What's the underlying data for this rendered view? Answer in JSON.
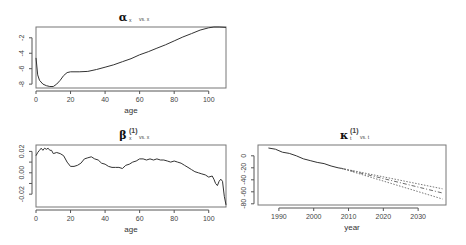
{
  "chart_data": [
    {
      "id": "alpha",
      "type": "line",
      "title": "α",
      "title_subscript": "x",
      "title_suffix": "vs. x",
      "xlabel": "age",
      "ylabel": "",
      "xlim": [
        0,
        110
      ],
      "ylim": [
        -8.5,
        -0.6
      ],
      "xticks": [
        0,
        20,
        40,
        60,
        80,
        100
      ],
      "yticks": [
        -2,
        -4,
        -6,
        -8
      ],
      "grid": false,
      "box": {
        "left": 36,
        "top": 27,
        "right": 226,
        "bottom": 88
      },
      "series": [
        {
          "name": "alpha_x",
          "style": "solid",
          "x": [
            0,
            1,
            2,
            4,
            6,
            8,
            10,
            12,
            14,
            16,
            18,
            20,
            25,
            30,
            35,
            40,
            45,
            50,
            55,
            60,
            65,
            70,
            75,
            80,
            85,
            90,
            95,
            100,
            103,
            106,
            110
          ],
          "y": [
            -4.6,
            -6.8,
            -7.5,
            -8.0,
            -8.2,
            -8.3,
            -8.3,
            -8.0,
            -7.5,
            -6.9,
            -6.5,
            -6.4,
            -6.4,
            -6.35,
            -6.1,
            -5.8,
            -5.5,
            -5.1,
            -4.7,
            -4.2,
            -3.8,
            -3.35,
            -2.9,
            -2.4,
            -1.9,
            -1.45,
            -1.0,
            -0.7,
            -0.6,
            -0.6,
            -0.65
          ]
        }
      ]
    },
    {
      "id": "beta",
      "type": "line",
      "title": "β",
      "title_subscript": "x",
      "title_superscript": "(1)",
      "title_suffix": "vs. x",
      "xlabel": "age",
      "ylabel": "",
      "xlim": [
        0,
        110
      ],
      "ylim": [
        -0.032,
        0.026
      ],
      "xticks": [
        0,
        20,
        40,
        60,
        80,
        100
      ],
      "yticks": [
        0.02,
        0.0,
        -0.02
      ],
      "ytick_labels": [
        "0.02",
        "0.00",
        "-0.02"
      ],
      "grid": false,
      "box": {
        "left": 36,
        "top": 145,
        "right": 226,
        "bottom": 207
      },
      "series": [
        {
          "name": "beta_x",
          "style": "solid",
          "x": [
            0,
            1,
            2,
            3,
            4,
            5,
            6,
            7,
            8,
            9,
            10,
            12,
            14,
            16,
            18,
            20,
            22,
            24,
            26,
            28,
            30,
            32,
            34,
            36,
            38,
            40,
            42,
            44,
            46,
            48,
            50,
            52,
            54,
            56,
            58,
            60,
            62,
            64,
            66,
            68,
            70,
            72,
            74,
            76,
            78,
            80,
            82,
            84,
            86,
            88,
            90,
            92,
            94,
            96,
            98,
            100,
            102,
            103,
            104,
            105,
            106,
            107,
            108,
            109,
            110
          ],
          "y": [
            0.016,
            0.019,
            0.021,
            0.023,
            0.021,
            0.023,
            0.022,
            0.023,
            0.021,
            0.021,
            0.018,
            0.019,
            0.018,
            0.016,
            0.01,
            0.006,
            0.006,
            0.007,
            0.009,
            0.013,
            0.014,
            0.015,
            0.013,
            0.012,
            0.009,
            0.008,
            0.006,
            0.005,
            0.005,
            0.005,
            0.004,
            0.007,
            0.008,
            0.01,
            0.011,
            0.013,
            0.013,
            0.012,
            0.013,
            0.012,
            0.013,
            0.012,
            0.012,
            0.011,
            0.01,
            0.011,
            0.01,
            0.009,
            0.007,
            0.005,
            0.003,
            0.001,
            0.0,
            -0.001,
            -0.002,
            -0.004,
            -0.003,
            -0.006,
            -0.01,
            -0.012,
            -0.008,
            -0.006,
            -0.008,
            -0.022,
            -0.03
          ]
        }
      ]
    },
    {
      "id": "kappa",
      "type": "line",
      "title": "κ",
      "title_subscript": "t",
      "title_superscript": "(1)",
      "title_suffix": "vs. t",
      "xlabel": "year",
      "ylabel": "",
      "xlim": [
        1984,
        2038
      ],
      "ylim": [
        -82,
        18
      ],
      "xticks": [
        1990,
        2000,
        2010,
        2020,
        2030
      ],
      "yticks": [
        0,
        -20,
        -40,
        -60,
        -80
      ],
      "grid": false,
      "box": {
        "left": 258,
        "top": 145,
        "right": 446,
        "bottom": 205
      },
      "series": [
        {
          "name": "kappa_t (fitted)",
          "style": "solid",
          "x": [
            1987,
            1989,
            1991,
            1993,
            1995,
            1997,
            1999,
            2001,
            2003,
            2005,
            2007,
            2008
          ],
          "y": [
            13,
            11,
            6,
            4,
            0,
            -5,
            -8,
            -11,
            -13,
            -17,
            -20,
            -21
          ]
        },
        {
          "name": "forecast mean",
          "style": "dashdot",
          "x": [
            2008,
            2037
          ],
          "y": [
            -21,
            -62
          ]
        },
        {
          "name": "upper 95% PI",
          "style": "dotted",
          "x": [
            2008,
            2037
          ],
          "y": [
            -21,
            -55
          ]
        },
        {
          "name": "lower 95% PI",
          "style": "dotted",
          "x": [
            2008,
            2037
          ],
          "y": [
            -21,
            -72
          ]
        }
      ]
    }
  ]
}
